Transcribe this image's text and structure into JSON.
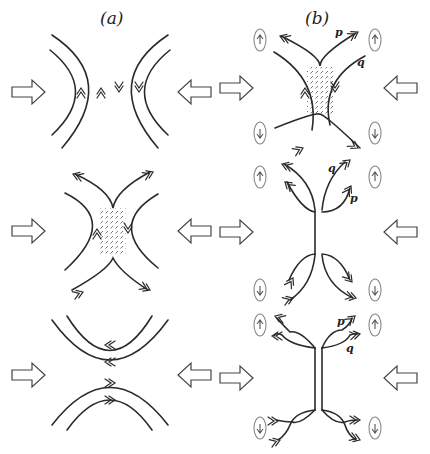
{
  "figure": {
    "column_labels": [
      "(a)",
      "(b)"
    ],
    "line_labels": {
      "row1": {
        "p": "p",
        "q": "q"
      },
      "row2": {
        "q": "q",
        "p": "p"
      },
      "row3": {
        "p": "p",
        "q": "q"
      }
    },
    "rows": [
      {
        "name": "row-1",
        "a": "two antiparallel curved field-line pairs approaching",
        "b": "X-shaped reconnection with dotted diffusion region and four vortices"
      },
      {
        "name": "row-2",
        "a": "X-shaped reconnection with dotted diffusion region",
        "b": "elongated current sheet with forked outflows and four vortices"
      },
      {
        "name": "row-3",
        "a": "reconnected field lines separating up and down",
        "b": "extended current sheet with twisted outflows and four vortices"
      }
    ],
    "inflow_arrow": "hollow-block-arrow",
    "colors": {
      "line": "#2a2a2a",
      "vortex": "#888888",
      "background": "#ffffff"
    }
  }
}
